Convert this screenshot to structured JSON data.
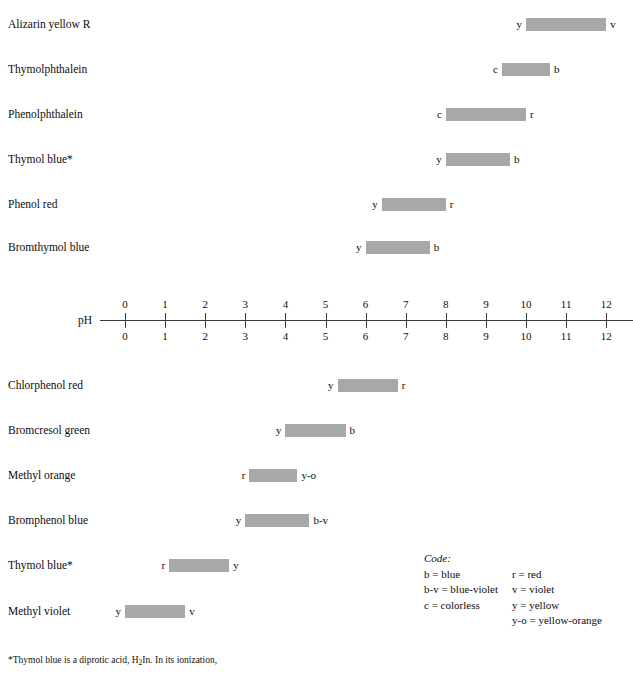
{
  "axis": {
    "name": "pH",
    "ticks": [
      0,
      1,
      2,
      3,
      4,
      5,
      6,
      7,
      8,
      9,
      10,
      11,
      12
    ],
    "min": 0,
    "max": 12
  },
  "legend": {
    "title": "Code:",
    "left_entries": [
      "b = blue",
      "b-v = blue-violet",
      "c = colorless"
    ],
    "right_entries": [
      "r = red",
      "v = violet",
      "y = yellow",
      "y-o = yellow-orange"
    ]
  },
  "footnote": {
    "line1_a": "*Thymol blue is a diprotic acid, H",
    "line1_sub": "2",
    "line1_b": "In. In its ionization,",
    "line2": ""
  },
  "chart_data": {
    "type": "bar",
    "xlabel": "pH",
    "ylabel": "",
    "xlim": [
      0,
      12
    ],
    "grid": false,
    "legend_position": "bottom-right",
    "bar_color": "#a8a8a8",
    "orientation": "horizontal",
    "indicators": [
      {
        "name": "Alizarin yellow R",
        "low": 10.0,
        "high": 12.0,
        "acid_code": "y",
        "base_code": "v",
        "group": "above-axis"
      },
      {
        "name": "Thymolphthalein",
        "low": 9.4,
        "high": 10.6,
        "acid_code": "c",
        "base_code": "b",
        "group": "above-axis"
      },
      {
        "name": "Phenolphthalein",
        "low": 8.0,
        "high": 10.0,
        "acid_code": "c",
        "base_code": "r",
        "group": "above-axis"
      },
      {
        "name": "Thymol blue*",
        "low": 8.0,
        "high": 9.6,
        "acid_code": "y",
        "base_code": "b",
        "group": "above-axis"
      },
      {
        "name": "Phenol red",
        "low": 6.4,
        "high": 8.0,
        "acid_code": "y",
        "base_code": "r",
        "group": "above-axis"
      },
      {
        "name": "Bromthymol blue",
        "low": 6.0,
        "high": 7.6,
        "acid_code": "y",
        "base_code": "b",
        "group": "above-axis"
      },
      {
        "name": "Chlorphenol red",
        "low": 5.3,
        "high": 6.8,
        "acid_code": "y",
        "base_code": "r",
        "group": "below-axis"
      },
      {
        "name": "Bromcresol green",
        "low": 4.0,
        "high": 5.5,
        "acid_code": "y",
        "base_code": "b",
        "group": "below-axis"
      },
      {
        "name": "Methyl orange",
        "low": 3.1,
        "high": 4.3,
        "acid_code": "r",
        "base_code": "y-o",
        "group": "below-axis"
      },
      {
        "name": "Bromphenol blue",
        "low": 3.0,
        "high": 4.6,
        "acid_code": "y",
        "base_code": "b-v",
        "group": "below-axis"
      },
      {
        "name": "Thymol blue*",
        "low": 1.1,
        "high": 2.6,
        "acid_code": "r",
        "base_code": "y",
        "group": "below-axis"
      },
      {
        "name": "Methyl violet",
        "low": 0.0,
        "high": 1.5,
        "acid_code": "y",
        "base_code": "v",
        "group": "below-axis"
      }
    ]
  }
}
